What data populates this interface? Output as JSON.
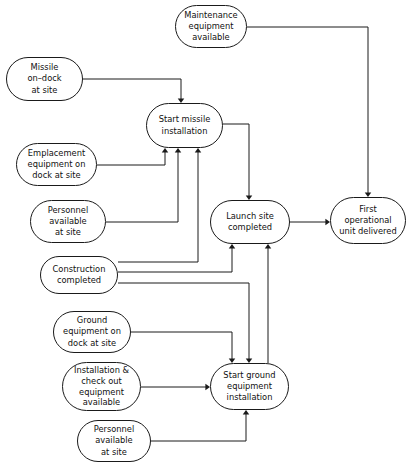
{
  "diagram": {
    "stroke_color": "#1a1a1a",
    "node_fill": "#ffffff",
    "background": "#ffffff",
    "nodes": [
      {
        "id": "maintenance",
        "label": "Maintenance\nequipment\navailable",
        "x": 175,
        "y": 5,
        "w": 72,
        "h": 43,
        "lines": 3
      },
      {
        "id": "missile_on_dock",
        "label": "Missile\non–dock\nat site",
        "x": 6,
        "y": 57,
        "w": 77,
        "h": 44,
        "lines": 3
      },
      {
        "id": "start_missile",
        "label": "Start missile\ninstallation",
        "x": 146,
        "y": 103,
        "w": 77,
        "h": 45,
        "lines": 2
      },
      {
        "id": "emplacement",
        "label": "Emplacement\nequipment on\ndock at site",
        "x": 16,
        "y": 143,
        "w": 81,
        "h": 43,
        "lines": 3
      },
      {
        "id": "personnel_upper",
        "label": "Personnel\navailable\nat site",
        "x": 30,
        "y": 200,
        "w": 76,
        "h": 43,
        "lines": 3
      },
      {
        "id": "launch_site",
        "label": "Launch site\ncompleted",
        "x": 210,
        "y": 200,
        "w": 80,
        "h": 44,
        "lines": 2
      },
      {
        "id": "first_unit",
        "label": "First\noperational\nunit delivered",
        "x": 330,
        "y": 197,
        "w": 76,
        "h": 47,
        "lines": 3
      },
      {
        "id": "construction",
        "label": "Construction\ncompleted",
        "x": 40,
        "y": 256,
        "w": 78,
        "h": 38,
        "lines": 2
      },
      {
        "id": "ground_equipment",
        "label": "Ground\nequipment on\ndock at site",
        "x": 53,
        "y": 311,
        "w": 78,
        "h": 42,
        "lines": 3
      },
      {
        "id": "installation_checkout",
        "label": "Installation &\ncheck out\nequipment\navailable",
        "x": 62,
        "y": 362,
        "w": 79,
        "h": 49,
        "lines": 4
      },
      {
        "id": "start_ground",
        "label": "Start ground\nequipment\ninstallation",
        "x": 210,
        "y": 363,
        "w": 79,
        "h": 47,
        "lines": 3
      },
      {
        "id": "personnel_lower",
        "label": "Personnel\navailable\nat site",
        "x": 77,
        "y": 420,
        "w": 74,
        "h": 42,
        "lines": 3
      }
    ],
    "edges": [
      {
        "id": "maintenance-to-first-unit",
        "from": "maintenance",
        "to": "first_unit",
        "path": "M 247,27 L 368,27 L 368,193",
        "arrow": {
          "x": 368,
          "y": 197,
          "dir": "down"
        }
      },
      {
        "id": "missile-on-dock-to-start-missile",
        "from": "missile_on_dock",
        "to": "start_missile",
        "path": "M 83,79 L 181,79 L 181,99",
        "arrow": {
          "x": 181,
          "y": 103,
          "dir": "down"
        }
      },
      {
        "id": "emplacement-to-start-missile",
        "from": "emplacement",
        "to": "start_missile",
        "path": "M 97,165 L 165,165 L 165,152",
        "arrow": {
          "x": 165,
          "y": 148,
          "dir": "up"
        }
      },
      {
        "id": "personnel-upper-to-start-missile",
        "from": "personnel_upper",
        "to": "start_missile",
        "path": "M 106,222 L 178,222 L 178,152",
        "arrow": {
          "x": 178,
          "y": 148,
          "dir": "up"
        }
      },
      {
        "id": "construction-to-start-missile",
        "from": "construction",
        "to": "start_missile",
        "path": "M 118,262 L 198,262 L 198,152",
        "arrow": {
          "x": 198,
          "y": 148,
          "dir": "up"
        }
      },
      {
        "id": "start-missile-to-launch-site",
        "from": "start_missile",
        "to": "launch_site",
        "path": "M 223,124 L 249,124 L 249,196",
        "arrow": {
          "x": 249,
          "y": 200,
          "dir": "down"
        }
      },
      {
        "id": "construction-to-launch-site",
        "from": "construction",
        "to": "launch_site",
        "path": "M 118,272 L 232,272 L 232,248",
        "arrow": {
          "x": 232,
          "y": 244,
          "dir": "up"
        }
      },
      {
        "id": "start-ground-to-launch-site",
        "from": "start_ground",
        "to": "launch_site",
        "path": "M 268,363 L 268,248",
        "arrow": {
          "x": 268,
          "y": 244,
          "dir": "up"
        }
      },
      {
        "id": "launch-site-to-first-unit",
        "from": "launch_site",
        "to": "first_unit",
        "path": "M 290,222 L 326,222",
        "arrow": {
          "x": 330,
          "y": 222,
          "dir": "right"
        }
      },
      {
        "id": "construction-to-start-ground",
        "from": "construction",
        "to": "start_ground",
        "path": "M 118,283 L 249,283 L 249,359",
        "arrow": {
          "x": 249,
          "y": 363,
          "dir": "down"
        }
      },
      {
        "id": "ground-equipment-to-start-ground",
        "from": "ground_equipment",
        "to": "start_ground",
        "path": "M 131,332 L 232,332 L 232,359",
        "arrow": {
          "x": 232,
          "y": 363,
          "dir": "down"
        }
      },
      {
        "id": "installation-checkout-to-start-ground",
        "from": "installation_checkout",
        "to": "start_ground",
        "path": "M 141,387 L 206,387",
        "arrow": {
          "x": 210,
          "y": 387,
          "dir": "right"
        }
      },
      {
        "id": "personnel-lower-to-start-ground",
        "from": "personnel_lower",
        "to": "start_ground",
        "path": "M 151,441 L 246,441 L 246,414",
        "arrow": {
          "x": 246,
          "y": 410,
          "dir": "up"
        }
      }
    ]
  }
}
